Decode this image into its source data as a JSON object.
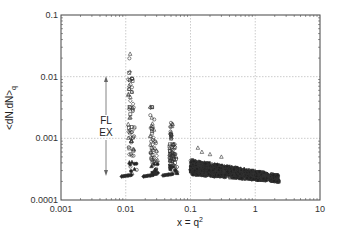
{
  "chart_data": {
    "type": "scatter",
    "title": "",
    "xlabel": "x = q²",
    "ylabel": "<dN.dN>q",
    "xscale": "log",
    "yscale": "log",
    "xlim": [
      0.001,
      10
    ],
    "ylim": [
      0.0001,
      0.1
    ],
    "grid": true,
    "xticks": [
      "0.001",
      "0.01",
      "0.1",
      "1",
      "10"
    ],
    "yticks": [
      "0.0001",
      "0.001",
      "0.01",
      "0.1"
    ],
    "annotations": [
      {
        "text": "FL",
        "x": 0.005,
        "y": 0.0025
      },
      {
        "text": "EX",
        "x": 0.005,
        "y": 0.0016
      },
      {
        "type": "double-arrow",
        "x": 0.005,
        "y_from": 0.0095,
        "y_to": 0.0004
      }
    ],
    "series": [
      {
        "name": "spike q≈0.011",
        "marker": "mixed",
        "x_center": 0.0115,
        "y_range": [
          0.00026,
          0.025
        ]
      },
      {
        "name": "spike q≈0.025",
        "marker": "mixed",
        "x_center": 0.025,
        "y_range": [
          0.00026,
          0.0045
        ]
      },
      {
        "name": "spike q≈0.05",
        "marker": "mixed",
        "x_center": 0.05,
        "y_range": [
          0.00027,
          0.0018
        ]
      },
      {
        "name": "band q>0.1",
        "marker": "filled",
        "x_range": [
          0.1,
          2.3
        ],
        "y_range": [
          0.00018,
          0.0005
        ]
      }
    ]
  },
  "labels": {
    "xlabel_main": "x = q",
    "xlabel_sup": "2",
    "ylabel": "<dN.dN>",
    "ylabel_sub": "q",
    "fl": "FL",
    "ex": "EX"
  }
}
